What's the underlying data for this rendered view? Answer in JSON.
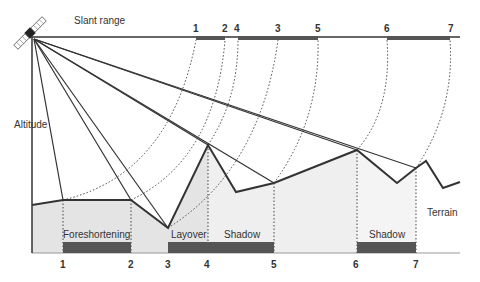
{
  "title_labels": {
    "slant_range": "Slant range",
    "altitude": "Altitude",
    "terrain": "Terrain"
  },
  "regions": {
    "foreshortening": "Foreshortening",
    "layover": "Layover",
    "shadow_1": "Shadow",
    "shadow_2": "Shadow"
  },
  "slant_range_ticks": [
    "1",
    "2",
    "4",
    "3",
    "5",
    "6",
    "7"
  ],
  "ground_range_ticks": [
    "1",
    "2",
    "3",
    "4",
    "5",
    "6",
    "7"
  ],
  "colors": {
    "line": "#333333",
    "bar": "#555555",
    "fill": "#e4e4e4",
    "fill_light": "#f2f2f2"
  }
}
